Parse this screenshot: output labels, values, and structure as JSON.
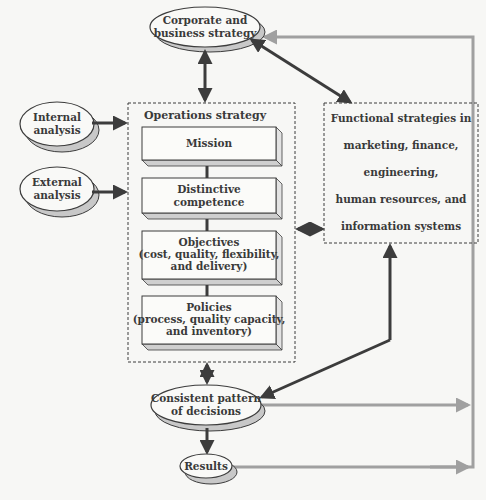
{
  "diagram": {
    "corporate": {
      "line1": "Corporate and",
      "line2": "business strategy"
    },
    "internal": {
      "line1": "Internal",
      "line2": "analysis"
    },
    "external": {
      "line1": "External",
      "line2": "analysis"
    },
    "operations": {
      "title": "Operations strategy",
      "boxes": [
        {
          "lines": [
            "Mission"
          ]
        },
        {
          "lines": [
            "Distinctive",
            "competence"
          ]
        },
        {
          "lines": [
            "Objectives",
            "(cost, quality, flexibility,",
            "and delivery)"
          ]
        },
        {
          "lines": [
            "Policies",
            "(process, quality capacity,",
            "and inventory)"
          ]
        }
      ]
    },
    "functional": {
      "lines": [
        "Functional strategies in",
        "marketing, finance,",
        "engineering,",
        "human resources, and",
        "information systems"
      ]
    },
    "consistent": {
      "line1": "Consistent pattern",
      "line2": "of decisions"
    },
    "results": {
      "label": "Results"
    },
    "colors": {
      "background": "#f7f7f5",
      "dark_arrow": "#3c3c3c",
      "gray_arrow": "#a0a0a0",
      "ellipse_shadow": "#c8c8c8",
      "box_side": "#cfcfcf",
      "text": "#3a3a3a"
    }
  }
}
